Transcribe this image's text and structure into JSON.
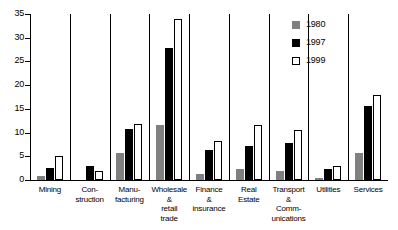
{
  "chart_data": {
    "type": "bar",
    "title": "",
    "subtitle": "",
    "xlabel": "",
    "ylabel": "",
    "ylim": [
      0,
      35
    ],
    "yticks": [
      0,
      5,
      10,
      15,
      20,
      25,
      30,
      35
    ],
    "grid": false,
    "legend_position": "top-right",
    "categories": [
      "Mining",
      "Con-\nstruction",
      "Manu-\nfacturing",
      "Wholesale\n&\nretail\ntrade",
      "Finance\n&\ninsurance",
      "Real\nEstate",
      "Transport\n&\nComm-\nunications",
      "Utilities",
      "Services"
    ],
    "series": [
      {
        "name": "1980",
        "color": "#808080",
        "values": [
          0.8,
          0.0,
          5.7,
          11.5,
          1.2,
          2.3,
          1.8,
          0.5,
          5.8
        ]
      },
      {
        "name": "1997",
        "color": "#000000",
        "values": [
          2.5,
          2.9,
          10.8,
          27.9,
          6.4,
          7.2,
          7.7,
          2.3,
          15.7
        ]
      },
      {
        "name": "1999",
        "color": "#ffffff",
        "values": [
          5.1,
          1.9,
          11.8,
          34.0,
          8.2,
          11.6,
          10.5,
          2.9,
          18.0
        ]
      }
    ],
    "legend": [
      {
        "label": "1980",
        "swatch": "gray-filled-square"
      },
      {
        "label": "1997",
        "swatch": "black-filled-square"
      },
      {
        "label": "1999",
        "swatch": "white-outlined-square"
      }
    ]
  }
}
